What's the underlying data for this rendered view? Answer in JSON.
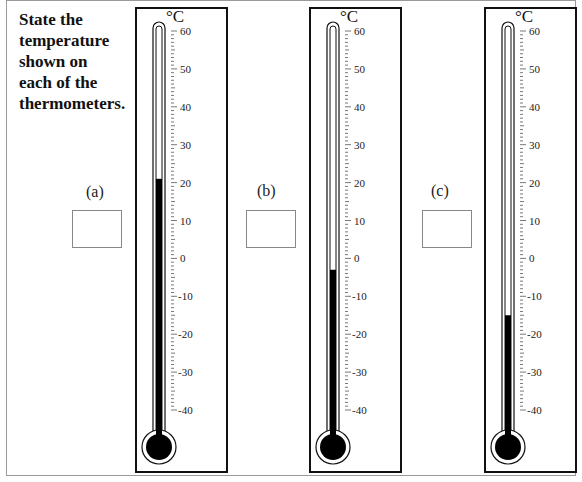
{
  "prompt": {
    "line1": "State the",
    "line2": "temperature",
    "line3": "shown on",
    "line4": "each of the",
    "line5": "thermometers."
  },
  "unit": "°C",
  "scale": {
    "min": -40,
    "max": 60,
    "major_step": 10,
    "labels": [
      "60",
      "50",
      "40",
      "30",
      "20",
      "10",
      "0",
      "-10",
      "-20",
      "-30",
      "-40"
    ]
  },
  "thermometers": [
    {
      "label": "(a)",
      "reading_c": 21,
      "answer": ""
    },
    {
      "label": "(b)",
      "reading_c": -3,
      "answer": ""
    },
    {
      "label": "(c)",
      "reading_c": -15,
      "answer": ""
    }
  ],
  "colors": {
    "mercury": "#000000",
    "frame": "#111111",
    "answer_box_border": "#888888"
  }
}
